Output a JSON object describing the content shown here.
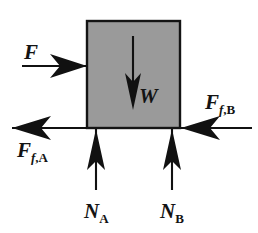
{
  "diagram": {
    "colors": {
      "block_fill": "#9a9a9a",
      "block_stroke": "#141414",
      "ink": "#111111",
      "background": "#ffffff"
    },
    "block": {
      "name": "block",
      "x": 87,
      "y": 21,
      "width": 93,
      "height": 107
    },
    "forces": [
      {
        "id": "applied",
        "label_main": "F",
        "label_sub_italic": "",
        "label_comma": "",
        "label_sub_roman": "",
        "direction": "right",
        "description": "applied horizontal force pushing block to the right",
        "line": {
          "x1": 22,
          "y1": 66,
          "x2": 87,
          "y2": 66
        },
        "label_pos": {
          "x": 24,
          "y": 59
        }
      },
      {
        "id": "weight",
        "label_main": "W",
        "label_sub_italic": "",
        "label_comma": "",
        "label_sub_roman": "",
        "direction": "down",
        "description": "weight of the block acting downward at its center",
        "line": {
          "x1": 133,
          "y1": 36,
          "x2": 133,
          "y2": 101
        },
        "label_pos": {
          "x": 139,
          "y": 103
        }
      },
      {
        "id": "friction-a",
        "label_main": "F",
        "label_sub_italic": "f",
        "label_comma": ",",
        "label_sub_roman": "A",
        "direction": "left",
        "description": "friction force at support A acting to the left",
        "line": {
          "x1": 87,
          "y1": 128,
          "x2": 12,
          "y2": 128
        },
        "label_pos": {
          "x": 17,
          "y": 157
        }
      },
      {
        "id": "friction-b",
        "label_main": "F",
        "label_sub_italic": "f",
        "label_comma": ",",
        "label_sub_roman": "B",
        "direction": "left",
        "description": "friction force at support B acting to the left",
        "line": {
          "x1": 252,
          "y1": 128,
          "x2": 181,
          "y2": 128
        },
        "label_pos": {
          "x": 205,
          "y": 109
        }
      },
      {
        "id": "normal-a",
        "label_main": "N",
        "label_sub_italic": "",
        "label_comma": "",
        "label_sub_roman": "A",
        "direction": "up",
        "description": "normal reaction at support A acting upward",
        "line": {
          "x1": 96,
          "y1": 190,
          "x2": 96,
          "y2": 129
        },
        "label_pos": {
          "x": 84,
          "y": 218
        }
      },
      {
        "id": "normal-b",
        "label_main": "N",
        "label_sub_italic": "",
        "label_comma": "",
        "label_sub_roman": "B",
        "direction": "up",
        "description": "normal reaction at support B acting upward",
        "line": {
          "x1": 172,
          "y1": 190,
          "x2": 172,
          "y2": 129
        },
        "label_pos": {
          "x": 160,
          "y": 218
        }
      }
    ]
  }
}
